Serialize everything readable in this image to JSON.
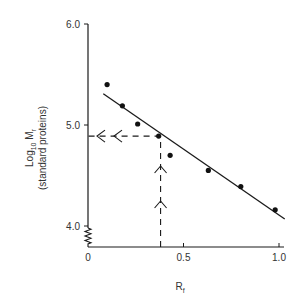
{
  "chart_data": {
    "type": "scatter",
    "title": "",
    "xlabel": "Rf",
    "xlabel_main": "R",
    "xlabel_sub": "f",
    "ylabel": "Log10 Mr (standard proteins)",
    "ylabel_line1_main": "Log",
    "ylabel_line1_sub": "10",
    "ylabel_line1_tail": " M",
    "ylabel_line1_tail_sub": "r",
    "ylabel_line2": "(standard proteins)",
    "xlim": [
      0,
      1.0
    ],
    "ylim": [
      4.0,
      6.0
    ],
    "x_ticks": [
      {
        "value": 0,
        "label": "0"
      },
      {
        "value": 0.5,
        "label": "0.5"
      },
      {
        "value": 1.0,
        "label": "1.0"
      }
    ],
    "y_ticks": [
      {
        "value": 4.0,
        "label": "4.0"
      },
      {
        "value": 5.0,
        "label": "5.0"
      },
      {
        "value": 6.0,
        "label": "6.0"
      }
    ],
    "y_axis_break": true,
    "grid": false,
    "series": [
      {
        "name": "Standard proteins",
        "x": [
          0.1,
          0.18,
          0.26,
          0.37,
          0.43,
          0.63,
          0.8,
          0.98
        ],
        "y": [
          5.4,
          5.19,
          5.01,
          4.89,
          4.7,
          4.55,
          4.39,
          4.16
        ]
      }
    ],
    "fit_line": {
      "x": [
        0.08,
        1.03
      ],
      "y": [
        5.31,
        4.07
      ]
    },
    "unknown_reading": {
      "rf": 0.38,
      "log_mr": 4.89
    },
    "annotations": [
      "Dashed vertical line from x-axis at Rf ≈ 0.38 up to the fit line with two upward arrows",
      "Dashed horizontal line from fit line left to y-axis at log Mr ≈ 4.89 with two leftward arrows"
    ]
  }
}
